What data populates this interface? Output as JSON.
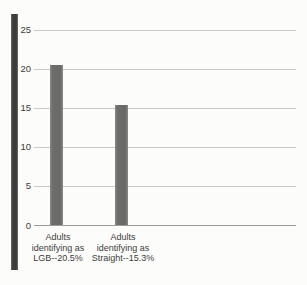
{
  "page": {
    "background_color": "#fcfcfa"
  },
  "chart_data": {
    "type": "bar",
    "title": "",
    "xlabel": "",
    "ylabel": "",
    "categories": [
      "Adults identifying as LGB--20.5%",
      "Adults identifying as Straight--15.3%"
    ],
    "category_lines": [
      [
        "Adults",
        "identifying as",
        "LGB--20.5%"
      ],
      [
        "Adults",
        "identifying as",
        "Straight--15.3%"
      ]
    ],
    "values": [
      20.5,
      15.3
    ],
    "ylim": [
      0,
      25
    ],
    "yticks": [
      0,
      5,
      10,
      15,
      20,
      25
    ],
    "grid": "horizontal gridlines at each y tick",
    "legend": "none",
    "colors": {
      "bar": "#6d6d6b",
      "axis_strip": "#3e3e3e",
      "gridline": "#c9c9c6",
      "baseline": "#9b9b98",
      "text": "#3c3c3c"
    }
  }
}
